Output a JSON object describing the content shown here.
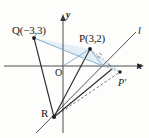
{
  "figure": {
    "kind": "coordinate-geometry-diagram",
    "axes": {
      "x_label": "x",
      "y_label": "y",
      "origin_label": "O"
    },
    "line_label": "l",
    "points": [
      {
        "id": "Q",
        "label": "Q(−3,3)",
        "coord_text": "(−3,3)",
        "x": 34,
        "y": 38
      },
      {
        "id": "P",
        "label": "P(3,2)",
        "coord_text": "(3,2)",
        "x": 90,
        "y": 49
      },
      {
        "id": "R",
        "label": "R",
        "coord_text": "",
        "x": 54,
        "y": 117
      },
      {
        "id": "Pp",
        "label": "P′",
        "coord_text": "",
        "x": 120,
        "y": 72
      }
    ],
    "colors": {
      "axis": "#3a3a3a",
      "ray": "#2f2f2f",
      "accent_light": "#7ca9c8",
      "fill_light": "#cfe2ef",
      "dashed": "#55585c",
      "background": "#fdfdfc",
      "text": "#161616"
    }
  }
}
